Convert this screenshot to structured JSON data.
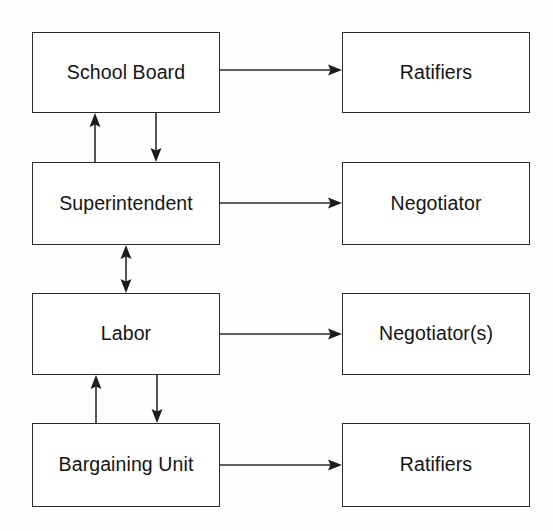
{
  "diagram": {
    "type": "flowchart",
    "background_color": "#ffffff",
    "line_color": "#2b2b2b",
    "text_color": "#141414",
    "nodes": [
      {
        "id": "school-board",
        "label": "School Board",
        "column": "left",
        "row": 1
      },
      {
        "id": "superintendent",
        "label": "Superintendent",
        "column": "left",
        "row": 2
      },
      {
        "id": "labor",
        "label": "Labor",
        "column": "left",
        "row": 3
      },
      {
        "id": "bargaining-unit",
        "label": "Bargaining Unit",
        "column": "left",
        "row": 4
      },
      {
        "id": "ratifiers-board",
        "label": "Ratifiers",
        "column": "right",
        "row": 1
      },
      {
        "id": "negotiator",
        "label": "Negotiator",
        "column": "right",
        "row": 2
      },
      {
        "id": "negotiators",
        "label": "Negotiator(s)",
        "column": "right",
        "row": 3
      },
      {
        "id": "ratifiers-unit",
        "label": "Ratifiers",
        "column": "right",
        "row": 4
      }
    ],
    "edges": [
      {
        "from": "school-board",
        "to": "ratifiers-board",
        "direction": "one-way",
        "orientation": "horizontal"
      },
      {
        "from": "superintendent",
        "to": "negotiator",
        "direction": "one-way",
        "orientation": "horizontal"
      },
      {
        "from": "labor",
        "to": "negotiators",
        "direction": "one-way",
        "orientation": "horizontal"
      },
      {
        "from": "bargaining-unit",
        "to": "ratifiers-unit",
        "direction": "one-way",
        "orientation": "horizontal"
      },
      {
        "from": "superintendent",
        "to": "school-board",
        "direction": "one-way",
        "orientation": "vertical-up"
      },
      {
        "from": "school-board",
        "to": "superintendent",
        "direction": "one-way",
        "orientation": "vertical-down"
      },
      {
        "from": "superintendent",
        "to": "labor",
        "direction": "two-way",
        "orientation": "vertical-both"
      },
      {
        "from": "bargaining-unit",
        "to": "labor",
        "direction": "one-way",
        "orientation": "vertical-up"
      },
      {
        "from": "labor",
        "to": "bargaining-unit",
        "direction": "one-way",
        "orientation": "vertical-down"
      }
    ]
  }
}
